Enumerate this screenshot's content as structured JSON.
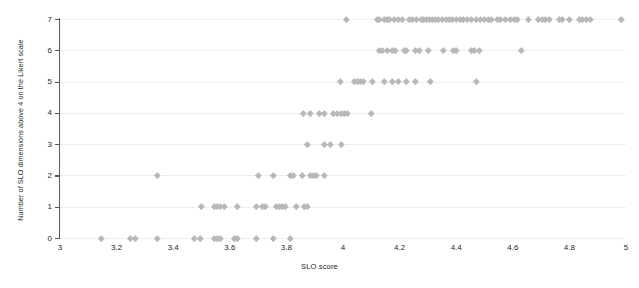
{
  "chart_data": {
    "type": "scatter",
    "title": "",
    "xlabel": "SLO score",
    "ylabel": "Number of SLO dimensions above 4 on the Likert scale",
    "xlim": [
      3,
      5
    ],
    "ylim": [
      0,
      7
    ],
    "xticks": [
      "3",
      "3.2",
      "3.4",
      "3.6",
      "3.8",
      "4",
      "4.2",
      "4.4",
      "4.6",
      "4.8",
      "5"
    ],
    "xtick_values": [
      3,
      3.2,
      3.4,
      3.6,
      3.8,
      4,
      4.2,
      4.4,
      4.6,
      4.8,
      5
    ],
    "yticks": [
      "0",
      "1",
      "2",
      "3",
      "4",
      "5",
      "6",
      "7"
    ],
    "ytick_values": [
      0,
      1,
      2,
      3,
      4,
      5,
      6,
      7
    ],
    "grid": "horizontal",
    "legend": "none",
    "marker": "diamond",
    "marker_color": "#b6b8ba",
    "axis_color": "#58595b",
    "grid_color": "#eceff1",
    "points": [
      {
        "x": 4.01,
        "y": 7
      },
      {
        "x": 4.12,
        "y": 7
      },
      {
        "x": 4.13,
        "y": 7
      },
      {
        "x": 4.145,
        "y": 7
      },
      {
        "x": 4.155,
        "y": 7
      },
      {
        "x": 4.165,
        "y": 7
      },
      {
        "x": 4.18,
        "y": 7
      },
      {
        "x": 4.195,
        "y": 7
      },
      {
        "x": 4.21,
        "y": 7
      },
      {
        "x": 4.235,
        "y": 7
      },
      {
        "x": 4.245,
        "y": 7
      },
      {
        "x": 4.26,
        "y": 7
      },
      {
        "x": 4.275,
        "y": 7
      },
      {
        "x": 4.285,
        "y": 7
      },
      {
        "x": 4.295,
        "y": 7
      },
      {
        "x": 4.305,
        "y": 7
      },
      {
        "x": 4.315,
        "y": 7
      },
      {
        "x": 4.325,
        "y": 7
      },
      {
        "x": 4.335,
        "y": 7
      },
      {
        "x": 4.35,
        "y": 7
      },
      {
        "x": 4.365,
        "y": 7
      },
      {
        "x": 4.375,
        "y": 7
      },
      {
        "x": 4.385,
        "y": 7
      },
      {
        "x": 4.4,
        "y": 7
      },
      {
        "x": 4.415,
        "y": 7
      },
      {
        "x": 4.425,
        "y": 7
      },
      {
        "x": 4.44,
        "y": 7
      },
      {
        "x": 4.455,
        "y": 7
      },
      {
        "x": 4.47,
        "y": 7
      },
      {
        "x": 4.485,
        "y": 7
      },
      {
        "x": 4.5,
        "y": 7
      },
      {
        "x": 4.515,
        "y": 7
      },
      {
        "x": 4.525,
        "y": 7
      },
      {
        "x": 4.545,
        "y": 7
      },
      {
        "x": 4.555,
        "y": 7
      },
      {
        "x": 4.575,
        "y": 7
      },
      {
        "x": 4.59,
        "y": 7
      },
      {
        "x": 4.605,
        "y": 7
      },
      {
        "x": 4.615,
        "y": 7
      },
      {
        "x": 4.655,
        "y": 7
      },
      {
        "x": 4.69,
        "y": 7
      },
      {
        "x": 4.705,
        "y": 7
      },
      {
        "x": 4.715,
        "y": 7
      },
      {
        "x": 4.73,
        "y": 7
      },
      {
        "x": 4.765,
        "y": 7
      },
      {
        "x": 4.775,
        "y": 7
      },
      {
        "x": 4.8,
        "y": 7
      },
      {
        "x": 4.835,
        "y": 7
      },
      {
        "x": 4.845,
        "y": 7
      },
      {
        "x": 4.86,
        "y": 7
      },
      {
        "x": 4.875,
        "y": 7
      },
      {
        "x": 4.985,
        "y": 7
      },
      {
        "x": 4.13,
        "y": 6
      },
      {
        "x": 4.14,
        "y": 6
      },
      {
        "x": 4.155,
        "y": 6
      },
      {
        "x": 4.175,
        "y": 6
      },
      {
        "x": 4.185,
        "y": 6
      },
      {
        "x": 4.215,
        "y": 6
      },
      {
        "x": 4.225,
        "y": 6
      },
      {
        "x": 4.255,
        "y": 6
      },
      {
        "x": 4.27,
        "y": 6
      },
      {
        "x": 4.3,
        "y": 6
      },
      {
        "x": 4.355,
        "y": 6
      },
      {
        "x": 4.39,
        "y": 6
      },
      {
        "x": 4.4,
        "y": 6
      },
      {
        "x": 4.455,
        "y": 6
      },
      {
        "x": 4.465,
        "y": 6
      },
      {
        "x": 4.48,
        "y": 6
      },
      {
        "x": 4.63,
        "y": 6
      },
      {
        "x": 3.99,
        "y": 5
      },
      {
        "x": 4.04,
        "y": 5
      },
      {
        "x": 4.05,
        "y": 5
      },
      {
        "x": 4.06,
        "y": 5
      },
      {
        "x": 4.07,
        "y": 5
      },
      {
        "x": 4.105,
        "y": 5
      },
      {
        "x": 4.145,
        "y": 5
      },
      {
        "x": 4.175,
        "y": 5
      },
      {
        "x": 4.195,
        "y": 5
      },
      {
        "x": 4.225,
        "y": 5
      },
      {
        "x": 4.255,
        "y": 5
      },
      {
        "x": 4.31,
        "y": 5
      },
      {
        "x": 4.47,
        "y": 5
      },
      {
        "x": 3.86,
        "y": 4
      },
      {
        "x": 3.885,
        "y": 4
      },
      {
        "x": 3.915,
        "y": 4
      },
      {
        "x": 3.935,
        "y": 4
      },
      {
        "x": 3.965,
        "y": 4
      },
      {
        "x": 3.98,
        "y": 4
      },
      {
        "x": 3.995,
        "y": 4
      },
      {
        "x": 4.005,
        "y": 4
      },
      {
        "x": 4.015,
        "y": 4
      },
      {
        "x": 4.1,
        "y": 4
      },
      {
        "x": 3.875,
        "y": 3
      },
      {
        "x": 3.935,
        "y": 3
      },
      {
        "x": 3.955,
        "y": 3
      },
      {
        "x": 3.995,
        "y": 3
      },
      {
        "x": 3.345,
        "y": 2
      },
      {
        "x": 3.7,
        "y": 2
      },
      {
        "x": 3.755,
        "y": 2
      },
      {
        "x": 3.815,
        "y": 2
      },
      {
        "x": 3.825,
        "y": 2
      },
      {
        "x": 3.855,
        "y": 2
      },
      {
        "x": 3.885,
        "y": 2
      },
      {
        "x": 3.895,
        "y": 2
      },
      {
        "x": 3.905,
        "y": 2
      },
      {
        "x": 3.935,
        "y": 2
      },
      {
        "x": 3.5,
        "y": 1
      },
      {
        "x": 3.545,
        "y": 1
      },
      {
        "x": 3.555,
        "y": 1
      },
      {
        "x": 3.565,
        "y": 1
      },
      {
        "x": 3.58,
        "y": 1
      },
      {
        "x": 3.625,
        "y": 1
      },
      {
        "x": 3.695,
        "y": 1
      },
      {
        "x": 3.715,
        "y": 1
      },
      {
        "x": 3.725,
        "y": 1
      },
      {
        "x": 3.765,
        "y": 1
      },
      {
        "x": 3.775,
        "y": 1
      },
      {
        "x": 3.785,
        "y": 1
      },
      {
        "x": 3.795,
        "y": 1
      },
      {
        "x": 3.835,
        "y": 1
      },
      {
        "x": 3.865,
        "y": 1
      },
      {
        "x": 3.875,
        "y": 1
      },
      {
        "x": 3.145,
        "y": 0
      },
      {
        "x": 3.25,
        "y": 0
      },
      {
        "x": 3.265,
        "y": 0
      },
      {
        "x": 3.345,
        "y": 0
      },
      {
        "x": 3.475,
        "y": 0
      },
      {
        "x": 3.495,
        "y": 0
      },
      {
        "x": 3.545,
        "y": 0
      },
      {
        "x": 3.555,
        "y": 0
      },
      {
        "x": 3.565,
        "y": 0
      },
      {
        "x": 3.615,
        "y": 0
      },
      {
        "x": 3.625,
        "y": 0
      },
      {
        "x": 3.695,
        "y": 0
      },
      {
        "x": 3.755,
        "y": 0
      },
      {
        "x": 3.815,
        "y": 0
      }
    ]
  }
}
